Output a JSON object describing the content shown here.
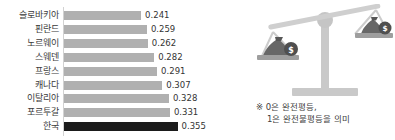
{
  "chart_data": {
    "type": "bar",
    "orientation": "horizontal",
    "title": "",
    "xlabel": "",
    "ylabel": "",
    "categories": [
      "슬로바키아",
      "핀란드",
      "노르웨이",
      "스웨덴",
      "프랑스",
      "캐나다",
      "이탈리아",
      "포르투갈",
      "한국"
    ],
    "values": [
      0.241,
      0.259,
      0.262,
      0.282,
      0.291,
      0.307,
      0.328,
      0.331,
      0.355
    ],
    "value_labels": [
      "0.241",
      "0.259",
      "0.262",
      "0.282",
      "0.291",
      "0.307",
      "0.328",
      "0.331",
      "0.355"
    ],
    "xlim": [
      0,
      0.4
    ],
    "grid": false,
    "legend": null,
    "highlight_category": "한국",
    "bar_color": "#b0b0b0",
    "highlight_color": "#1b1b1b"
  },
  "illustration": {
    "name": "balance-scale",
    "coin_symbol": "$",
    "left_pan_coin": "$",
    "right_pan_coin": "$"
  },
  "note": {
    "line1": "※ 0은 완전평등,",
    "line2": "1은 완전불평등을 의미"
  },
  "colors": {
    "background": "#ffffff",
    "bar": "#b0b0b0",
    "bar_highlight": "#1b1b1b",
    "axis": "#d2d2d2",
    "text": "#3b3b3b",
    "illustration_light": "#c9c9c9",
    "illustration_dark": "#555555"
  }
}
